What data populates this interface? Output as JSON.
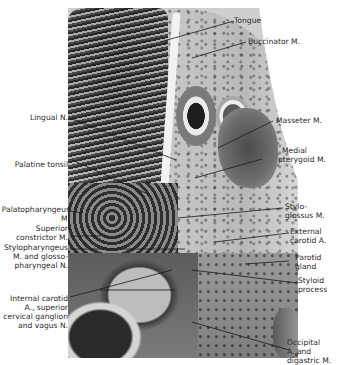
{
  "figure": {
    "labels_right": [
      {
        "id": "tongue",
        "lines": [
          "Tongue"
        ]
      },
      {
        "id": "buccinator",
        "lines": [
          "Buccinator M."
        ]
      },
      {
        "id": "masseter",
        "lines": [
          "Masseter M."
        ]
      },
      {
        "id": "medial-pterygoid",
        "lines": [
          "Medial",
          "pterygoid M."
        ]
      },
      {
        "id": "styloglossus",
        "lines": [
          "Stylo-",
          "glossus M."
        ]
      },
      {
        "id": "external-carotid",
        "lines": [
          "External",
          "carotid A."
        ]
      },
      {
        "id": "parotid",
        "lines": [
          "Parotid",
          "gland"
        ]
      },
      {
        "id": "styloid",
        "lines": [
          "Styloid",
          "process"
        ]
      },
      {
        "id": "occipital",
        "lines": [
          "Occipital",
          "A. and",
          "digastric M."
        ]
      }
    ],
    "labels_left": [
      {
        "id": "lingual-nerve",
        "lines": [
          "Lingual N."
        ]
      },
      {
        "id": "palatine-tonsil",
        "lines": [
          "Palatine tonsil"
        ]
      },
      {
        "id": "palatopharyngeus",
        "lines": [
          "Palatopharyngeus",
          "M."
        ]
      },
      {
        "id": "superior-constrictor",
        "lines": [
          "Superior",
          "constrictor M."
        ]
      },
      {
        "id": "stylopharyngeus",
        "lines": [
          "Stylopharyngeus",
          "M. and glosso-",
          "pharyngeal N."
        ]
      },
      {
        "id": "internal-carotid",
        "lines": [
          "Internal carotid",
          "A., superior",
          "cervical ganglion",
          "and vagus N."
        ]
      }
    ]
  }
}
